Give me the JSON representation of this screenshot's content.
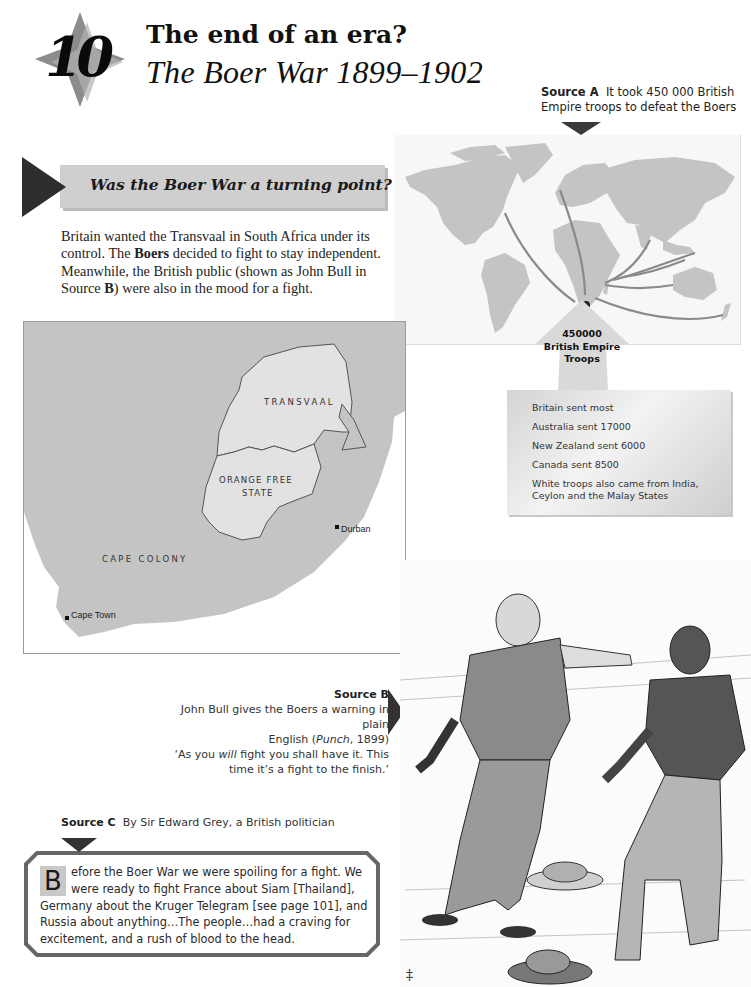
{
  "chapter": {
    "number": "10",
    "title": "The end of an era?",
    "subtitle": "The Boer War 1899–1902"
  },
  "section": {
    "heading": "Was the Boer War a turning point?",
    "intro_parts": [
      "Britain wanted the Transvaal in South Africa under its control. The ",
      "Boers",
      " decided to fight to stay independent. Meanwhile, the British public (shown as John Bull in Source ",
      "B",
      ") were also in the mood for a fight."
    ]
  },
  "source_a": {
    "label": "Source A",
    "caption": "It took 450 000 British Empire troops to defeat the Boers",
    "map_callout": {
      "count": "450000",
      "line1": "British Empire",
      "line2": "Troops"
    },
    "breakdown": [
      "Britain sent most",
      "Australia sent 17000",
      "New Zealand sent 6000",
      "Canada sent 8500",
      "White troops also came from India, Ceylon and the Malay States"
    ]
  },
  "sa_map": {
    "regions": {
      "transvaal": "TRANSVAAL",
      "orange_free_state_1": "ORANGE FREE",
      "orange_free_state_2": "STATE",
      "cape_colony": "CAPE COLONY"
    },
    "towns": {
      "durban": "Durban",
      "cape_town": "Cape Town"
    }
  },
  "source_b": {
    "label": "Source B",
    "line1": "John Bull gives the Boers a warning in plain",
    "line2a": "English (",
    "line2_pub": "Punch",
    "line2b": ", 1899)",
    "quote1a": "‘As you ",
    "quote1_em": "will",
    "quote1b": " fight you shall have it. This",
    "quote2": "time it’s a fight to the finish.’"
  },
  "source_c": {
    "label": "Source C",
    "caption": "By Sir Edward Grey, a British politician",
    "dropcap": "B",
    "text": "efore the Boer War we were spoiling for a fight. We were ready to fight France about Siam [Thailand], Germany about the Kruger Telegram [see page 101], and Russia about anything…The people…had a craving for excitement, and a rush of blood to the head."
  },
  "colors": {
    "banner_bg": "#cfcfcf",
    "arrow_dark": "#2e2e2e",
    "land_gray": "#c4c4c4",
    "boer_states": "#e0e0e0"
  }
}
